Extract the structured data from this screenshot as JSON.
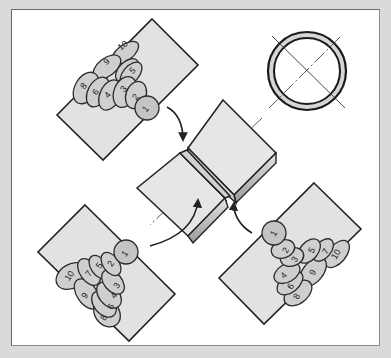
{
  "figure": {
    "pipe_section_symbol": "circle-with-crosshair",
    "views": [
      {
        "position": "top-left",
        "bead_labels": [
          "1",
          "2",
          "3",
          "4",
          "5",
          "6",
          "7",
          "8",
          "9",
          "10"
        ]
      },
      {
        "position": "bottom-left",
        "bead_labels": [
          "1",
          "2",
          "3",
          "4",
          "5",
          "6",
          "7",
          "8",
          "9",
          "10"
        ]
      },
      {
        "position": "bottom-right",
        "bead_labels": [
          "1",
          "2",
          "3",
          "4",
          "5",
          "6",
          "7",
          "8",
          "9",
          "10"
        ]
      }
    ]
  },
  "labels": {
    "tl": {
      "b1": "1",
      "b2": "2",
      "b3": "3",
      "b4": "4",
      "b5": "5",
      "b6": "6",
      "b7": "7",
      "b8": "8",
      "b9": "9",
      "b10": "10"
    },
    "bl": {
      "b1": "1",
      "b2": "2",
      "b3": "3",
      "b4": "4",
      "b5": "5",
      "b6": "6",
      "b7": "7",
      "b8": "8",
      "b9": "9",
      "b10": "10"
    },
    "br": {
      "b1": "1",
      "b2": "2",
      "b3": "3",
      "b4": "4",
      "b5": "5",
      "b6": "6",
      "b7": "7",
      "b8": "8",
      "b9": "9",
      "b10": "10"
    }
  },
  "colors": {
    "frame": "#dadada",
    "panel": "#ffffff",
    "plate": "#e2e2e2",
    "bead": "#cfcfcf",
    "line": "#222222"
  }
}
